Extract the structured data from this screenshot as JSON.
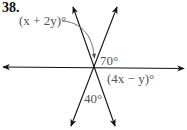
{
  "problem": {
    "number": "38."
  },
  "angles": {
    "upper_label": "(x + 2y)°",
    "upper_right": "70°",
    "right_lower": "(4x − y)°",
    "bottom": "40°"
  },
  "colors": {
    "line": "#111111",
    "label": "#555555"
  }
}
